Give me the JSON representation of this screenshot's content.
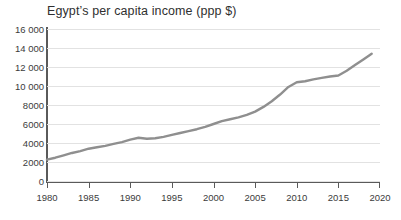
{
  "chart_data": {
    "type": "line",
    "title": "Egyptʼs per capita income (ppp $)",
    "xlabel": "",
    "ylabel": "",
    "xlim": [
      1980,
      2020
    ],
    "ylim": [
      0,
      16000
    ],
    "grid": "horizontal",
    "legend": "none",
    "line_color": "#8f8f8f",
    "x": [
      1980,
      1981,
      1982,
      1983,
      1984,
      1985,
      1986,
      1987,
      1988,
      1989,
      1990,
      1991,
      1992,
      1993,
      1994,
      1995,
      1996,
      1997,
      1998,
      1999,
      2000,
      2001,
      2002,
      2003,
      2004,
      2005,
      2006,
      2007,
      2008,
      2009,
      2010,
      2011,
      2012,
      2013,
      2014,
      2015,
      2016,
      2017,
      2018,
      2019
    ],
    "values": [
      2250,
      2450,
      2700,
      2950,
      3150,
      3400,
      3550,
      3700,
      3900,
      4100,
      4350,
      4550,
      4450,
      4500,
      4650,
      4850,
      5050,
      5250,
      5450,
      5700,
      6000,
      6300,
      6500,
      6700,
      6950,
      7300,
      7800,
      8400,
      9100,
      9900,
      10400,
      10500,
      10700,
      10850,
      11000,
      11100,
      11600,
      12200,
      12800,
      13400
    ],
    "ytick_values": [
      0,
      2000,
      4000,
      6000,
      8000,
      10000,
      12000,
      14000,
      16000
    ],
    "ytick_labels": [
      "0",
      "2000",
      "4000",
      "6000",
      "8000",
      "10 000",
      "12 000",
      "14 000",
      "16 000"
    ],
    "xtick_values": [
      1980,
      1985,
      1990,
      1995,
      2000,
      2005,
      2010,
      2015,
      2020
    ],
    "xtick_labels": [
      "1980",
      "1985",
      "1990",
      "1995",
      "2000",
      "2005",
      "2010",
      "2015",
      "2020"
    ]
  }
}
